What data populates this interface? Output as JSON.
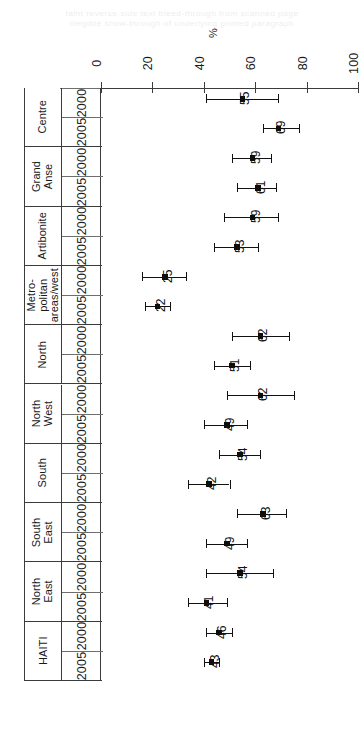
{
  "artifact": {
    "line1": "faint reverse-side text bleed-through from scanned page",
    "line2": "illegible show-through of underlying printed paragraph"
  },
  "chart_data": {
    "type": "scatter",
    "title": "",
    "subtitle": "",
    "xlabel": "%",
    "ylabel": "",
    "orientation": "horizontal",
    "grid": false,
    "legend": "none",
    "error_bars": "confidence interval",
    "xlim": [
      0,
      100
    ],
    "xticks": [
      0,
      20,
      40,
      60,
      80,
      100
    ],
    "xtick_labels": [
      "0",
      "20",
      "40",
      "60",
      "80",
      "100"
    ],
    "year_labels": [
      "2000",
      "2005"
    ],
    "groups": [
      {
        "name": "Centre",
        "name_lines": [
          "Centre"
        ],
        "rows": [
          {
            "year": "2000",
            "value": 55,
            "label": "55",
            "low": 41,
            "high": 69
          },
          {
            "year": "2005",
            "value": 69,
            "label": "69",
            "low": 63,
            "high": 77
          }
        ]
      },
      {
        "name": "Grand Anse",
        "name_lines": [
          "Grand",
          "Anse"
        ],
        "rows": [
          {
            "year": "2000",
            "value": 59,
            "label": "59",
            "low": 51,
            "high": 66
          },
          {
            "year": "2005",
            "value": 61,
            "label": "61",
            "low": 53,
            "high": 68
          }
        ]
      },
      {
        "name": "Artibonite",
        "name_lines": [
          "Artibonite"
        ],
        "rows": [
          {
            "year": "2000",
            "value": 59,
            "label": "59",
            "low": 48,
            "high": 69
          },
          {
            "year": "2005",
            "value": 53,
            "label": "53",
            "low": 44,
            "high": 61
          }
        ]
      },
      {
        "name": "Metro-politan areas/west",
        "name_lines": [
          "Metro-",
          "politan",
          "areas/west"
        ],
        "rows": [
          {
            "year": "2000",
            "value": 25,
            "label": "25",
            "low": 16,
            "high": 33
          },
          {
            "year": "2005",
            "value": 22,
            "label": "22",
            "low": 17,
            "high": 27
          }
        ]
      },
      {
        "name": "North",
        "name_lines": [
          "North"
        ],
        "rows": [
          {
            "year": "2000",
            "value": 62,
            "label": "62",
            "low": 51,
            "high": 73
          },
          {
            "year": "2005",
            "value": 51,
            "label": "51",
            "low": 44,
            "high": 58
          }
        ]
      },
      {
        "name": "North West",
        "name_lines": [
          "North",
          "West"
        ],
        "rows": [
          {
            "year": "2000",
            "value": 62,
            "label": "62",
            "low": 49,
            "high": 75
          },
          {
            "year": "2005",
            "value": 49,
            "label": "49",
            "low": 40,
            "high": 57
          }
        ]
      },
      {
        "name": "South",
        "name_lines": [
          "South"
        ],
        "rows": [
          {
            "year": "2000",
            "value": 54,
            "label": "54",
            "low": 46,
            "high": 62
          },
          {
            "year": "2005",
            "value": 42,
            "label": "42",
            "low": 34,
            "high": 50
          }
        ]
      },
      {
        "name": "South East",
        "name_lines": [
          "South",
          "East"
        ],
        "rows": [
          {
            "year": "2000",
            "value": 63,
            "label": "63",
            "low": 53,
            "high": 72
          },
          {
            "year": "2005",
            "value": 49,
            "label": "49",
            "low": 41,
            "high": 57
          }
        ]
      },
      {
        "name": "North East",
        "name_lines": [
          "North",
          "East"
        ],
        "rows": [
          {
            "year": "2000",
            "value": 54,
            "label": "54",
            "low": 41,
            "high": 67
          },
          {
            "year": "2005",
            "value": 41,
            "label": "41",
            "low": 34,
            "high": 49
          }
        ]
      },
      {
        "name": "HAITI",
        "name_lines": [
          "HAITI"
        ],
        "rows": [
          {
            "year": "2000",
            "value": 46,
            "label": "46",
            "low": 41,
            "high": 51
          },
          {
            "year": "2005",
            "value": 43,
            "label": "43",
            "low": 40,
            "high": 46
          }
        ]
      }
    ]
  }
}
